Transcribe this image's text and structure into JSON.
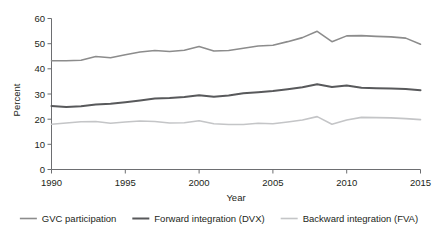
{
  "chart_data": {
    "type": "line",
    "title": "",
    "xlabel": "Year",
    "ylabel": "Percent",
    "xlim": [
      1990,
      2015
    ],
    "ylim": [
      0,
      60
    ],
    "xticks": [
      1990,
      1995,
      2000,
      2005,
      2010,
      2015
    ],
    "yticks": [
      0,
      10,
      20,
      30,
      40,
      50,
      60
    ],
    "grid": false,
    "legend_position": "bottom",
    "x": [
      1990,
      1991,
      1992,
      1993,
      1994,
      1995,
      1996,
      1997,
      1998,
      1999,
      2000,
      2001,
      2002,
      2003,
      2004,
      2005,
      2006,
      2007,
      2008,
      2009,
      2010,
      2011,
      2012,
      2013,
      2014,
      2015
    ],
    "series": [
      {
        "name": "GVC participation",
        "color": "#8c8c8c",
        "values": [
          43.2,
          43.2,
          43.4,
          44.9,
          44.4,
          45.6,
          46.7,
          47.3,
          46.9,
          47.4,
          48.9,
          47.1,
          47.3,
          48.2,
          49.1,
          49.4,
          50.8,
          52.4,
          54.9,
          50.8,
          53.1,
          53.2,
          52.9,
          52.7,
          52.2,
          49.8
        ]
      },
      {
        "name": "Forward integration (DVX)",
        "color": "#58595b",
        "values": [
          25.2,
          24.8,
          25.1,
          25.8,
          26.1,
          26.7,
          27.4,
          28.2,
          28.4,
          28.8,
          29.5,
          28.9,
          29.4,
          30.3,
          30.7,
          31.2,
          31.9,
          32.7,
          33.9,
          32.8,
          33.4,
          32.5,
          32.3,
          32.2,
          32.0,
          31.5
        ]
      },
      {
        "name": "Backward integration (FVA)",
        "color": "#c4c5c7",
        "values": [
          18.0,
          18.5,
          19.0,
          19.1,
          18.4,
          18.9,
          19.3,
          19.1,
          18.5,
          18.6,
          19.4,
          18.2,
          17.9,
          17.9,
          18.4,
          18.2,
          18.9,
          19.7,
          21.0,
          18.0,
          19.7,
          20.7,
          20.6,
          20.5,
          20.2,
          19.8
        ]
      }
    ],
    "legend": [
      {
        "label": "GVC participation",
        "color": "#8c8c8c",
        "width": 1.6
      },
      {
        "label": "Forward integration (DVX)",
        "color": "#58595b",
        "width": 2.0
      },
      {
        "label": "Backward integration (FVA)",
        "color": "#c4c5c7",
        "width": 1.6
      }
    ]
  },
  "axis": {
    "x_title": "Year",
    "y_title": "Percent"
  }
}
